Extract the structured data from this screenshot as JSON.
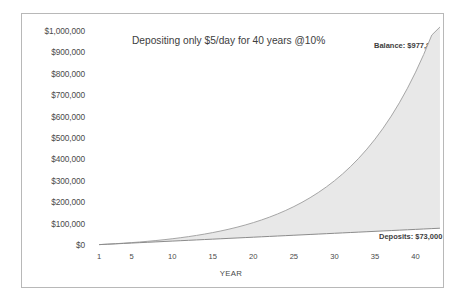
{
  "chart_data": {
    "type": "area",
    "title": "Depositing only $5/day for 40 years @10%",
    "xlabel": "YEAR",
    "ylabel": "",
    "xlim": [
      0,
      43.5
    ],
    "ylim": [
      0,
      1000000
    ],
    "grid": false,
    "legend_position": "none",
    "x_ticks": [
      "1",
      "5",
      "10",
      "15",
      "20",
      "25",
      "30",
      "35",
      "40"
    ],
    "x_tick_values": [
      1,
      5,
      10,
      15,
      20,
      25,
      30,
      35,
      40
    ],
    "y_ticks": [
      "$0",
      "$100,000",
      "$200,000",
      "$300,000",
      "$400,000",
      "$500,000",
      "$600,000",
      "$700,000",
      "$800,000",
      "$900,000",
      "$1,000,000"
    ],
    "y_tick_values": [
      0,
      100000,
      200000,
      300000,
      400000,
      500000,
      600000,
      700000,
      800000,
      900000,
      1000000
    ],
    "annotations": [
      {
        "text": "Balance: $977,888",
        "value": 977888
      },
      {
        "text": "Deposits: $73,000",
        "value": 73000
      }
    ],
    "series": [
      {
        "name": "Balance",
        "fill": "#e8e8e8",
        "line_color": "#a6a6a6",
        "x": [
          1,
          2,
          3,
          4,
          5,
          6,
          7,
          8,
          9,
          10,
          11,
          12,
          13,
          14,
          15,
          16,
          17,
          18,
          19,
          20,
          21,
          22,
          23,
          24,
          25,
          26,
          27,
          28,
          29,
          30,
          31,
          32,
          33,
          34,
          35,
          36,
          37,
          38,
          39,
          40,
          41,
          42,
          43
        ],
        "values": [
          1825,
          3833,
          6041,
          8470,
          11142,
          14081,
          17314,
          20871,
          24783,
          29086,
          33820,
          39027,
          44754,
          51055,
          57986,
          65610,
          73996,
          83221,
          93369,
          104531,
          116809,
          130315,
          145172,
          161514,
          179491,
          199265,
          221017,
          244944,
          271263,
          300215,
          332062,
          367093,
          405627,
          448015,
          494642,
          545931,
          602349,
          664409,
          732675,
          807768,
          890370,
          981232,
          1081180
        ]
      },
      {
        "name": "Deposits",
        "line_color": "#8c8c8c",
        "x": [
          1,
          2,
          3,
          4,
          5,
          6,
          7,
          8,
          9,
          10,
          11,
          12,
          13,
          14,
          15,
          16,
          17,
          18,
          19,
          20,
          21,
          22,
          23,
          24,
          25,
          26,
          27,
          28,
          29,
          30,
          31,
          32,
          33,
          34,
          35,
          36,
          37,
          38,
          39,
          40,
          41,
          42,
          43
        ],
        "values": [
          1825,
          3650,
          5475,
          7300,
          9125,
          10950,
          12775,
          14600,
          16425,
          18250,
          20075,
          21900,
          23725,
          25550,
          27375,
          29200,
          31025,
          32850,
          34675,
          36500,
          38325,
          40150,
          41975,
          43800,
          45625,
          47450,
          49275,
          51100,
          52925,
          54750,
          56575,
          58400,
          60225,
          62050,
          63875,
          65700,
          67525,
          69350,
          71175,
          73000,
          74825,
          76650,
          78475
        ]
      }
    ]
  },
  "colors": {
    "area_fill": "#e8e8e8",
    "balance_line": "#a6a6a6",
    "deposits_line": "#8c8c8c",
    "frame": "#b8b8b8",
    "text": "#4a4a4a"
  }
}
